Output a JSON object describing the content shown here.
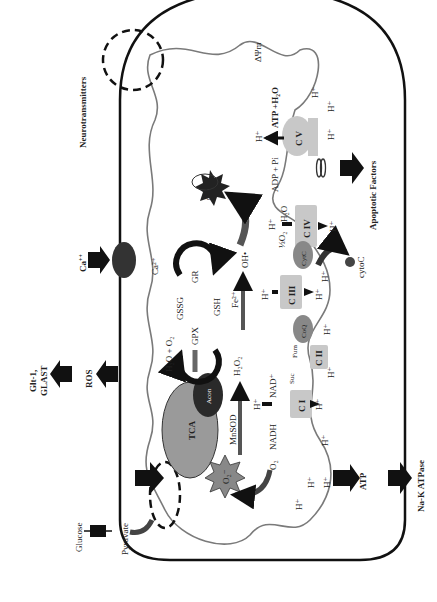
{
  "diagram": {
    "outside_labels": {
      "neurotransmitters": "Neurotransmitters",
      "apoptotic_factors": "Apoptotic Factors",
      "ca": "Ca",
      "ca_sup": "++",
      "glt": "Glt-1,",
      "glast": "GLAST",
      "ros": "ROS",
      "atp": "ATP",
      "na_k_atpase": "Na-K ATPase",
      "glucose": "Glucose",
      "pyruvate": "Pyruvate",
      "cytoc": "cytoC"
    },
    "matrix_labels": {
      "delta_psi": "ΔΨm",
      "atp_h2o": "ATP  +H₂O",
      "adp_pi": "ADP + Pi",
      "cv": "C V",
      "civ": "C IV",
      "ciii": "C III",
      "cii": "C II",
      "ci": "C I",
      "cytc": "CytC",
      "coq": "CoQ",
      "half_o2": "½O₂",
      "h2o": "H₂O",
      "mtdna": "mtDNA",
      "oh": "OH•",
      "fe2": "Fe²⁺",
      "h2o2": "H₂O₂",
      "h2o_o2": "H₂O + O₂",
      "gssg": "GSSG",
      "gsh": "GSH",
      "gr": "GR",
      "gpx": "GPX",
      "ca2": "Ca²⁺",
      "tca": "TCA",
      "acon": "Acon",
      "mnsod": "MnSOD",
      "o2_radical": "O₂⁻",
      "o2": "O₂",
      "nadh": "NADH",
      "nad": "NAD⁺",
      "suc": "Suc",
      "fum": "Fum",
      "h_plus": "H⁺"
    },
    "colors": {
      "membrane": "#111111",
      "inner_membrane": "#7a7a7a",
      "complex_fill": "#c8c8c8",
      "tca_fill": "#9a9a9a",
      "dark_fill": "#2a2a2a",
      "arrow_dark": "#444444"
    }
  }
}
